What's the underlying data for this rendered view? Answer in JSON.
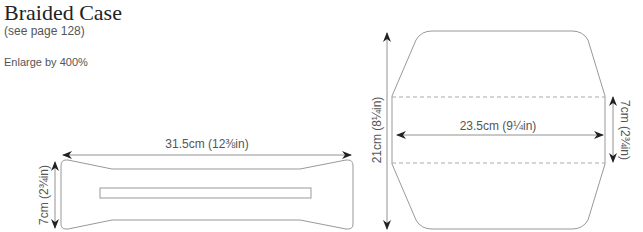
{
  "header": {
    "title": "Braided Case",
    "subtitle": "(see page 128)",
    "note": "Enlarge by 400%"
  },
  "diagrams": {
    "strap": {
      "width_label": "31.5cm (12⅜in)",
      "height_label": "7cm (2¾in)"
    },
    "body": {
      "height_label": "21cm (8¼in)",
      "width_label": "23.5cm (9¼in)",
      "band_label": "7cm (2¾in)"
    }
  },
  "colors": {
    "outline": "#999999",
    "arrow": "#222222",
    "text": "#555555"
  }
}
